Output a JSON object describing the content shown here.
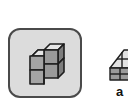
{
  "palette": {
    "items": [
      {
        "icon": "cube-stack-icon",
        "selected": true,
        "label": ""
      },
      {
        "icon": "pyramid-cubes-icon",
        "selected": false,
        "label": "a"
      }
    ]
  },
  "colors": {
    "background": "#ffffff",
    "tile_selected_bg": "#dcdcdc",
    "tile_border": "#4a4a4a",
    "cube_face": "#9a9a9a",
    "cube_top": "#e6e6e6",
    "cube_side": "#7e7e7e"
  }
}
